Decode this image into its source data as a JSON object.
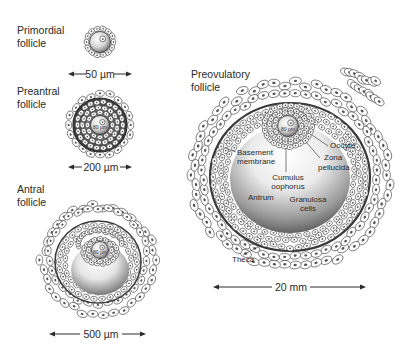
{
  "figure": {
    "colors": {
      "background": "#ffffff",
      "outline": "#2b2b2b",
      "cell_fill": "#ffffff",
      "antrum_light": "#ffffff",
      "antrum_dark": "#5a5a5a",
      "basement_membrane": "#3a3a3a",
      "text": "#2a2a2a"
    }
  },
  "stages": [
    {
      "id": "primordial",
      "label_line1": "Primordial",
      "label_line2": "follicle",
      "scale_label": "50 µm",
      "oocyte_label": ""
    },
    {
      "id": "preantral",
      "label_line1": "Preantral",
      "label_line2": "follicle",
      "scale_label": "200 µm",
      "oocyte_label": "80 µm"
    },
    {
      "id": "antral",
      "label_line1": "Antral",
      "label_line2": "follicle",
      "scale_label": "500 µm",
      "oocyte_label": "80 µm"
    },
    {
      "id": "preovulatory",
      "label_line1": "Preovulatory",
      "label_line2": "follicle",
      "scale_label": "20 mm",
      "oocyte_label": "80 µm"
    }
  ],
  "annotations": {
    "oocyte": "Oocyte",
    "zona_line1": "Zona",
    "zona_line2": "pellucida",
    "basement_line1": "Basement",
    "basement_line2": "membrane",
    "cumulus_line1": "Cumulus",
    "cumulus_line2": "oophorus",
    "antrum": "Antrum",
    "granulosa_line1": "Granulosa",
    "granulosa_line2": "cells",
    "theca": "Theca"
  }
}
